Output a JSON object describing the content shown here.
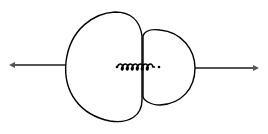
{
  "diagram": {
    "description": "Two bodies of unequal size held against a compressed spring, pushed apart in opposite directions",
    "bodies": [
      {
        "name": "large-body",
        "side": "left"
      },
      {
        "name": "small-body",
        "side": "right"
      }
    ],
    "spring": {
      "state": "compressed",
      "coils": 7
    },
    "arrows": [
      {
        "name": "left-velocity-arrow",
        "direction": "left"
      },
      {
        "name": "right-velocity-arrow",
        "direction": "right"
      }
    ],
    "colors": {
      "outline": "#000000",
      "arrow": "#555555",
      "background": "#ffffff"
    }
  }
}
